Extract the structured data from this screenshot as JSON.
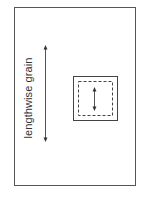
{
  "diagram": {
    "type": "fabric-grain-layout",
    "label": "lengthwise grain",
    "elements": {
      "fabric_outline": {
        "shape": "rectangle",
        "stroke": "#555555"
      },
      "grain_arrow": {
        "direction": "vertical",
        "double_headed": true,
        "stroke": "#444444"
      },
      "pattern_piece": {
        "outer": {
          "shape": "square",
          "style": "solid",
          "stroke": "#444444"
        },
        "inner": {
          "shape": "square",
          "style": "dashed",
          "stroke": "#444444"
        },
        "grainline_arrow": {
          "direction": "vertical",
          "double_headed": true
        }
      }
    },
    "colors": {
      "background": "#ffffff",
      "line": "#444444",
      "text": "#333333"
    }
  }
}
